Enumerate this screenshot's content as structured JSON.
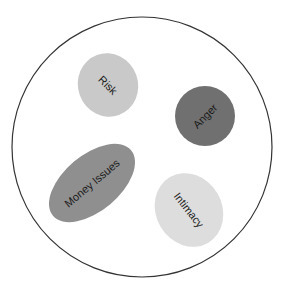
{
  "diagram": {
    "container": {
      "shape": "circle",
      "stroke": "#333333",
      "fill": "#ffffff"
    },
    "items": [
      {
        "label": "Risk",
        "fill": "#c9c9c9"
      },
      {
        "label": "Anger",
        "fill": "#707070"
      },
      {
        "label": "Money Issues",
        "fill": "#8f8f8f"
      },
      {
        "label": "Intimacy",
        "fill": "#dddddd"
      }
    ]
  }
}
